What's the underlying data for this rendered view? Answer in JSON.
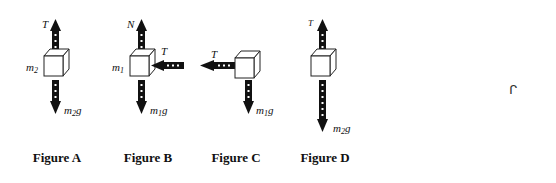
{
  "figures": [
    {
      "id": "A",
      "caption": "Figure A",
      "block_label": {
        "main": "m",
        "sub": "2"
      },
      "forces": [
        {
          "direction": "up",
          "label": "T"
        },
        {
          "direction": "down",
          "label_main": "m",
          "label_sub": "2",
          "label_tail": "g"
        }
      ]
    },
    {
      "id": "B",
      "caption": "Figure B",
      "block_label": {
        "main": "m",
        "sub": "1"
      },
      "forces": [
        {
          "direction": "up",
          "label": "N"
        },
        {
          "direction": "left",
          "label": "T"
        },
        {
          "direction": "down",
          "label_main": "m",
          "label_sub": "1",
          "label_tail": "g"
        }
      ]
    },
    {
      "id": "C",
      "caption": "Figure C",
      "forces": [
        {
          "direction": "left",
          "label": "T"
        },
        {
          "direction": "down",
          "label_main": "m",
          "label_sub": "1",
          "label_tail": "g"
        }
      ]
    },
    {
      "id": "D",
      "caption": "Figure D",
      "forces": [
        {
          "direction": "up",
          "label": "T"
        },
        {
          "direction": "down",
          "label_main": "m",
          "label_sub": "2",
          "label_tail": "g"
        }
      ]
    }
  ],
  "stray_mark": "ᒋ",
  "colors": {
    "arrow": "#111111",
    "block_stroke": "#222222",
    "block_fill": "#ffffff",
    "dash": "#ffffff"
  }
}
